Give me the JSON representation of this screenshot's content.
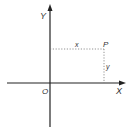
{
  "diagram": {
    "type": "cartesian-coordinates",
    "labels": {
      "y_axis": "Y",
      "x_axis": "X",
      "origin": "O",
      "point": "P",
      "x_distance": "x",
      "y_distance": "y"
    },
    "colors": {
      "axis": "#222222",
      "dotted": "#777777",
      "text": "#333333",
      "background": "#ffffff"
    },
    "geometry": {
      "origin": [
        50,
        83
      ],
      "point_p": [
        104,
        49
      ],
      "x_axis_extent": [
        7,
        125
      ],
      "y_axis_extent": [
        5,
        127
      ]
    }
  }
}
